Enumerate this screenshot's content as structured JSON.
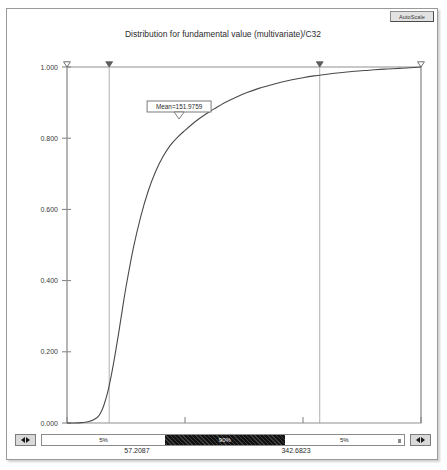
{
  "window": {
    "autoscale_label": "AutoScale"
  },
  "chart_data": {
    "type": "line",
    "title": "Distribution for fundamental value (multivariate)/C32",
    "xlabel": "",
    "ylabel": "",
    "xlim": [
      0,
      480
    ],
    "ylim": [
      0,
      1.0
    ],
    "grid": false,
    "legend": null,
    "x_ticks": [
      "0",
      "160",
      "320",
      "480"
    ],
    "x_tick_values": [
      0,
      160,
      320,
      480
    ],
    "y_ticks": [
      "0.000",
      "0.200",
      "0.400",
      "0.600",
      "0.800",
      "1.000"
    ],
    "y_tick_values": [
      0.0,
      0.2,
      0.4,
      0.6,
      0.8,
      1.0
    ],
    "series": [
      {
        "name": "Cumulative distribution",
        "x": [
          0,
          10,
          20,
          30,
          40,
          45,
          50,
          55,
          60,
          65,
          70,
          75,
          80,
          90,
          100,
          110,
          120,
          130,
          140,
          150,
          160,
          170,
          180,
          190,
          200,
          215,
          230,
          245,
          260,
          275,
          290,
          305,
          320,
          335,
          350,
          370,
          390,
          410,
          430,
          450,
          465,
          480
        ],
        "y": [
          0.0,
          0.0,
          0.001,
          0.004,
          0.014,
          0.026,
          0.05,
          0.085,
          0.133,
          0.19,
          0.252,
          0.318,
          0.382,
          0.492,
          0.58,
          0.651,
          0.706,
          0.748,
          0.78,
          0.803,
          0.822,
          0.84,
          0.856,
          0.87,
          0.883,
          0.901,
          0.916,
          0.929,
          0.94,
          0.949,
          0.957,
          0.964,
          0.97,
          0.975,
          0.979,
          0.984,
          0.988,
          0.991,
          0.994,
          0.996,
          0.998,
          1.0
        ]
      }
    ],
    "annotations": [
      {
        "name": "mean-marker",
        "label": "Mean=151.9759",
        "value": 151.9759
      }
    ],
    "markers": [
      {
        "name": "range-handle-left-outer",
        "style": "open",
        "value": 0
      },
      {
        "name": "range-handle-left-inner",
        "style": "filled",
        "value": 57.2087
      },
      {
        "name": "range-handle-right-inner",
        "style": "filled",
        "value": 342.6823
      },
      {
        "name": "range-handle-right-outer",
        "style": "open",
        "value": 480
      }
    ]
  },
  "slider": {
    "nudge_left_icon": "left-right-arrows-icon",
    "nudge_right_icon": "left-right-arrows-icon",
    "segments": [
      {
        "name": "lower-tail",
        "label": "5%"
      },
      {
        "name": "central-band",
        "label": "90%"
      },
      {
        "name": "upper-tail",
        "label": "5%"
      }
    ],
    "low_value": "57.2087",
    "high_value": "342.6823"
  }
}
